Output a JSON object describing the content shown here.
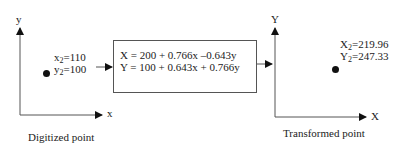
{
  "left_panel": {
    "axis_y_label": "y",
    "axis_x_label": "x",
    "point": {
      "x_name": "x",
      "x_sub": "2",
      "x_value": "=110",
      "y_name": "y",
      "y_sub": "2",
      "y_value": "=100"
    },
    "caption": "Digitized point"
  },
  "transform_box": {
    "eq1": "X = 200 + 0.766x –0.643y",
    "eq2": "Y = 100 + 0.643x + 0.766y"
  },
  "right_panel": {
    "axis_y_label": "Y",
    "axis_x_label": "X",
    "point": {
      "x_name": "X",
      "x_sub": "2",
      "x_value": "=219.96",
      "y_name": "Y",
      "y_sub": "2",
      "y_value": "=247.33"
    },
    "caption": "Transformed point"
  },
  "colors": {
    "line": "#555555",
    "text": "#222222",
    "dot": "#111111"
  }
}
